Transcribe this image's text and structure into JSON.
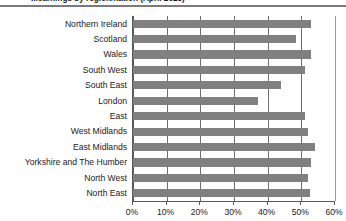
{
  "chart_data": {
    "type": "bar",
    "orientation": "horizontal",
    "title": "...earnings by region/nation (April 2023)",
    "xlabel": "",
    "ylabel": "",
    "xlim": [
      0,
      60
    ],
    "grid": true,
    "legend": "none",
    "categories": [
      "Northern Ireland",
      "Scotland",
      "Wales",
      "South West",
      "South East",
      "London",
      "East",
      "West Midlands",
      "East Midlands",
      "Yorkshire and The Humber",
      "North West",
      "North East"
    ],
    "values": [
      53,
      48.5,
      53,
      51,
      44,
      37,
      51,
      52,
      54,
      53,
      52,
      52.5
    ],
    "xticks": [
      0,
      10,
      20,
      30,
      40,
      50,
      60
    ],
    "xtick_labels": [
      "0%",
      "10%",
      "20%",
      "30%",
      "40%",
      "50%",
      "60%"
    ],
    "bar_color": "#808080",
    "gridline_color": "#6e6e6e",
    "axis_color": "#5a5a5a"
  }
}
